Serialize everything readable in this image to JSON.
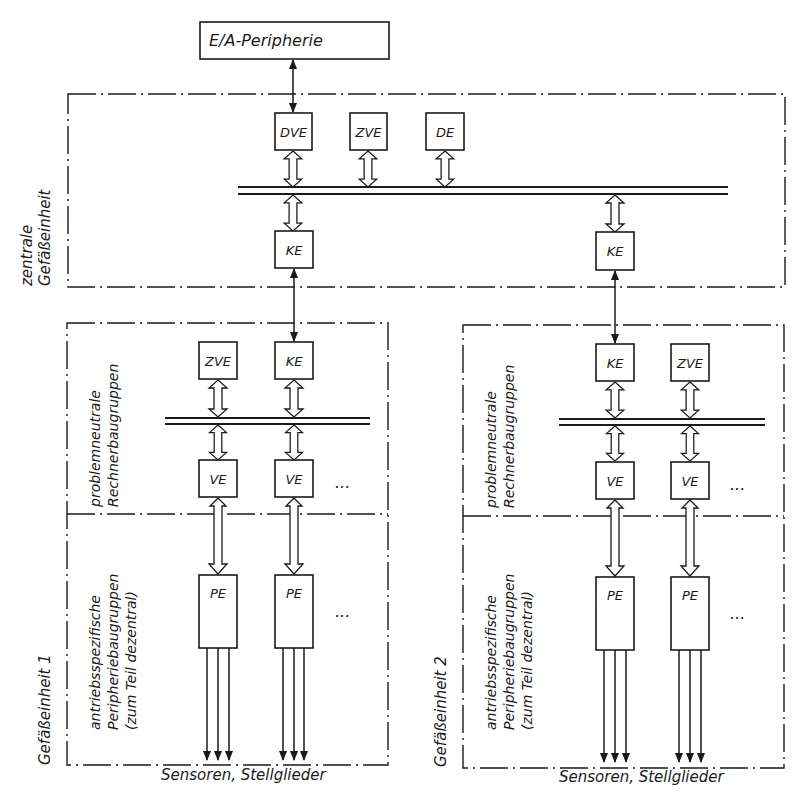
{
  "diagram": {
    "top_box": {
      "label": "E/A-Peripherie"
    },
    "central_unit": {
      "label_line1": "zentrale",
      "label_line2": "Gefäßeinheit",
      "modules": [
        {
          "label": "DVE"
        },
        {
          "label": "ZVE"
        },
        {
          "label": "DE"
        }
      ],
      "couplers": [
        {
          "label": "KE"
        },
        {
          "label": "KE"
        }
      ]
    },
    "units": [
      {
        "name": "Gefäßeinheit 1",
        "upper_section_line1": "problemneutrale",
        "upper_section_line2": "Rechnerbaugruppen",
        "lower_section_line1": "antriebsspezifische",
        "lower_section_line2": "Peripheriebaugruppen",
        "lower_section_line3": "(zum Teil dezentral)",
        "top_modules": [
          {
            "label": "ZVE"
          },
          {
            "label": "KE"
          }
        ],
        "ve_modules": [
          {
            "label": "VE"
          },
          {
            "label": "VE"
          }
        ],
        "pe_modules": [
          {
            "label": "PE"
          },
          {
            "label": "PE"
          }
        ],
        "ellipsis": "...",
        "outputs_label": "Sensoren, Stellglieder"
      },
      {
        "name": "Gefäßeinheit 2",
        "upper_section_line1": "problemneutrale",
        "upper_section_line2": "Rechnerbaugruppen",
        "lower_section_line1": "antriebsspezifische",
        "lower_section_line2": "Peripheriebaugruppen",
        "lower_section_line3": "(zum Teil dezentral)",
        "top_modules": [
          {
            "label": "KE"
          },
          {
            "label": "ZVE"
          }
        ],
        "ve_modules": [
          {
            "label": "VE"
          },
          {
            "label": "VE"
          }
        ],
        "pe_modules": [
          {
            "label": "PE"
          },
          {
            "label": "PE"
          }
        ],
        "ellipsis": "...",
        "outputs_label": "Sensoren, Stellglieder"
      }
    ]
  }
}
